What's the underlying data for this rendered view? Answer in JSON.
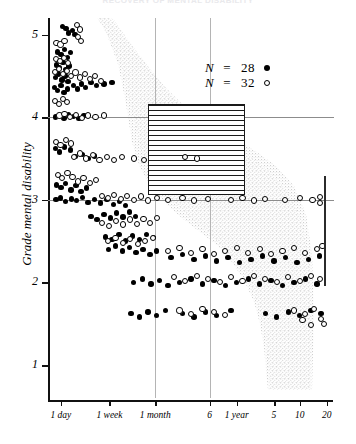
{
  "figure": {
    "title": "RECOVERY OF MENTAL DISABILITY",
    "type": "scatter"
  },
  "axes": {
    "y": {
      "label": "Grade mental disability",
      "ticks": [
        "5",
        "4",
        "3",
        "2",
        "1"
      ],
      "tick_values": [
        5,
        4,
        3,
        2,
        1
      ],
      "range": [
        0.6,
        5.2
      ]
    },
    "x": {
      "label": "",
      "ticks": [
        "1 day",
        "1 week",
        "1 month",
        "6",
        "1 year",
        "5",
        "10",
        "20"
      ],
      "scale": "log-time"
    }
  },
  "legend": {
    "position": "upper-right",
    "entries": [
      {
        "n_symbol": "N",
        "equals": "=",
        "value": "28",
        "marker": "filled"
      },
      {
        "n_symbol": "N",
        "equals": "=",
        "value": "32",
        "marker": "open"
      }
    ]
  },
  "annotations": {
    "hatched_box": {
      "name": "hatched-region",
      "x_from": "1 month",
      "x_to": "6",
      "y_from": 4,
      "y_to": 3,
      "pattern": "horizontal-lines"
    },
    "right_bracket": {
      "name": "range-bracket",
      "y_from": 3.05,
      "y_to": 2.05
    },
    "envelope": {
      "name": "stippled-envelope",
      "description": "grey stippled band of recovery trajectory"
    },
    "gridlines": {
      "horizontal": [
        4,
        3
      ],
      "vertical": [
        "1 month",
        "6"
      ]
    }
  },
  "colors": {
    "ink": "#000000",
    "grid": "#8c8c8c",
    "grid_light": "#b4b4b4",
    "stipple": "#c9c9c9",
    "title_faded": "#e9e9ec"
  },
  "chart_data": {
    "type": "scatter",
    "title": "RECOVERY OF MENTAL DISABILITY",
    "xlabel": "",
    "ylabel": "Grade mental disability",
    "xlim": [
      0,
      1
    ],
    "ylim": [
      0.6,
      5.2
    ],
    "grid": true,
    "legend_position": "upper-right",
    "xtick_labels": [
      "1 day",
      "1 week",
      "1 month",
      "6",
      "1 year",
      "5",
      "10",
      "20"
    ],
    "xtick_positions": [
      0.045,
      0.215,
      0.375,
      0.565,
      0.66,
      0.79,
      0.88,
      0.975
    ],
    "ytick_labels": [
      "5",
      "4",
      "3",
      "2",
      "1"
    ],
    "ytick_positions": [
      5,
      4,
      3,
      2,
      1
    ],
    "series": [
      {
        "name": "N = 28",
        "marker": "filled",
        "n": 28,
        "points": [
          [
            0.05,
            5.1
          ],
          [
            0.063,
            5.07
          ],
          [
            0.072,
            5.02
          ],
          [
            0.086,
            5.05
          ],
          [
            0.095,
            5.0
          ],
          [
            0.034,
            4.79
          ],
          [
            0.046,
            4.76
          ],
          [
            0.058,
            4.82
          ],
          [
            0.068,
            4.72
          ],
          [
            0.079,
            4.78
          ],
          [
            0.03,
            4.63
          ],
          [
            0.041,
            4.6
          ],
          [
            0.052,
            4.66
          ],
          [
            0.063,
            4.58
          ],
          [
            0.074,
            4.62
          ],
          [
            0.026,
            4.48
          ],
          [
            0.037,
            4.52
          ],
          [
            0.049,
            4.45
          ],
          [
            0.06,
            4.5
          ],
          [
            0.07,
            4.43
          ],
          [
            0.022,
            4.36
          ],
          [
            0.034,
            4.32
          ],
          [
            0.045,
            4.38
          ],
          [
            0.056,
            4.3
          ],
          [
            0.068,
            4.34
          ],
          [
            0.09,
            4.38
          ],
          [
            0.104,
            4.34
          ],
          [
            0.118,
            4.4
          ],
          [
            0.132,
            4.36
          ],
          [
            0.15,
            4.42
          ],
          [
            0.17,
            4.38
          ],
          [
            0.196,
            4.4
          ],
          [
            0.224,
            4.42
          ],
          [
            0.026,
            4.0
          ],
          [
            0.04,
            4.02
          ],
          [
            0.056,
            3.99
          ],
          [
            0.072,
            4.03
          ],
          [
            0.09,
            4.01
          ],
          [
            0.108,
            3.98
          ],
          [
            0.126,
            4.02
          ],
          [
            0.026,
            3.62
          ],
          [
            0.04,
            3.58
          ],
          [
            0.058,
            3.64
          ],
          [
            0.078,
            3.6
          ],
          [
            0.096,
            3.52
          ],
          [
            0.12,
            3.55
          ],
          [
            0.14,
            3.5
          ],
          [
            0.162,
            3.53
          ],
          [
            0.03,
            3.18
          ],
          [
            0.046,
            3.15
          ],
          [
            0.062,
            3.2
          ],
          [
            0.08,
            3.12
          ],
          [
            0.098,
            3.17
          ],
          [
            0.116,
            3.1
          ],
          [
            0.134,
            3.14
          ],
          [
            0.028,
            3.0
          ],
          [
            0.044,
            3.02
          ],
          [
            0.062,
            2.98
          ],
          [
            0.082,
            3.01
          ],
          [
            0.1,
            2.99
          ],
          [
            0.12,
            3.03
          ],
          [
            0.14,
            2.97
          ],
          [
            0.162,
            3.0
          ],
          [
            0.184,
            2.96
          ],
          [
            0.206,
            3.0
          ],
          [
            0.228,
            2.94
          ],
          [
            0.25,
            2.98
          ],
          [
            0.272,
            2.93
          ],
          [
            0.15,
            2.8
          ],
          [
            0.172,
            2.76
          ],
          [
            0.196,
            2.82
          ],
          [
            0.218,
            2.78
          ],
          [
            0.24,
            2.84
          ],
          [
            0.262,
            2.79
          ],
          [
            0.284,
            2.85
          ],
          [
            0.306,
            2.8
          ],
          [
            0.2,
            2.55
          ],
          [
            0.224,
            2.52
          ],
          [
            0.248,
            2.58
          ],
          [
            0.272,
            2.5
          ],
          [
            0.296,
            2.56
          ],
          [
            0.32,
            2.52
          ],
          [
            0.344,
            2.58
          ],
          [
            0.368,
            2.54
          ],
          [
            0.212,
            2.4
          ],
          [
            0.236,
            2.44
          ],
          [
            0.26,
            2.38
          ],
          [
            0.284,
            2.42
          ],
          [
            0.308,
            2.36
          ],
          [
            0.332,
            2.4
          ],
          [
            0.356,
            2.34
          ],
          [
            0.38,
            2.38
          ],
          [
            0.43,
            2.3
          ],
          [
            0.47,
            2.34
          ],
          [
            0.51,
            2.28
          ],
          [
            0.55,
            2.32
          ],
          [
            0.59,
            2.26
          ],
          [
            0.63,
            2.3
          ],
          [
            0.67,
            2.24
          ],
          [
            0.71,
            2.28
          ],
          [
            0.75,
            2.32
          ],
          [
            0.79,
            2.26
          ],
          [
            0.83,
            2.3
          ],
          [
            0.87,
            2.24
          ],
          [
            0.91,
            2.28
          ],
          [
            0.95,
            2.32
          ],
          [
            0.3,
            2.0
          ],
          [
            0.33,
            2.04
          ],
          [
            0.36,
            1.98
          ],
          [
            0.39,
            2.02
          ],
          [
            0.42,
            1.96
          ],
          [
            0.46,
            2.0
          ],
          [
            0.5,
            2.04
          ],
          [
            0.54,
            1.98
          ],
          [
            0.58,
            2.02
          ],
          [
            0.62,
            1.96
          ],
          [
            0.66,
            2.0
          ],
          [
            0.7,
            2.04
          ],
          [
            0.74,
            1.98
          ],
          [
            0.78,
            2.02
          ],
          [
            0.82,
            1.96
          ],
          [
            0.86,
            2.0
          ],
          [
            0.9,
            2.04
          ],
          [
            0.94,
            1.98
          ],
          [
            0.29,
            1.62
          ],
          [
            0.32,
            1.58
          ],
          [
            0.35,
            1.64
          ],
          [
            0.38,
            1.6
          ],
          [
            0.41,
            1.66
          ],
          [
            0.47,
            1.62
          ],
          [
            0.51,
            1.58
          ],
          [
            0.55,
            1.64
          ],
          [
            0.59,
            1.6
          ],
          [
            0.64,
            1.66
          ],
          [
            0.76,
            1.62
          ],
          [
            0.8,
            1.58
          ],
          [
            0.84,
            1.64
          ],
          [
            0.88,
            1.6
          ],
          [
            0.92,
            1.66
          ],
          [
            0.955,
            1.62
          ]
        ]
      },
      {
        "name": "N = 32",
        "marker": "open",
        "n": 32,
        "points": [
          [
            0.1,
            5.12
          ],
          [
            0.112,
            5.06
          ],
          [
            0.104,
            4.97
          ],
          [
            0.116,
            4.92
          ],
          [
            0.03,
            4.9
          ],
          [
            0.044,
            4.88
          ],
          [
            0.058,
            4.92
          ],
          [
            0.028,
            4.7
          ],
          [
            0.042,
            4.68
          ],
          [
            0.056,
            4.72
          ],
          [
            0.07,
            4.66
          ],
          [
            0.024,
            4.55
          ],
          [
            0.038,
            4.58
          ],
          [
            0.052,
            4.52
          ],
          [
            0.066,
            4.56
          ],
          [
            0.08,
            4.5
          ],
          [
            0.096,
            4.54
          ],
          [
            0.112,
            4.48
          ],
          [
            0.128,
            4.52
          ],
          [
            0.146,
            4.46
          ],
          [
            0.164,
            4.5
          ],
          [
            0.184,
            4.44
          ],
          [
            0.024,
            4.2
          ],
          [
            0.038,
            4.16
          ],
          [
            0.052,
            4.22
          ],
          [
            0.066,
            4.18
          ],
          [
            0.04,
            4.02
          ],
          [
            0.058,
            4.04
          ],
          [
            0.078,
            4.0
          ],
          [
            0.098,
            4.03
          ],
          [
            0.118,
            3.99
          ],
          [
            0.14,
            4.02
          ],
          [
            0.166,
            4.0
          ],
          [
            0.196,
            4.02
          ],
          [
            0.028,
            3.7
          ],
          [
            0.044,
            3.66
          ],
          [
            0.062,
            3.72
          ],
          [
            0.08,
            3.68
          ],
          [
            0.09,
            3.52
          ],
          [
            0.112,
            3.56
          ],
          [
            0.134,
            3.5
          ],
          [
            0.156,
            3.54
          ],
          [
            0.18,
            3.48
          ],
          [
            0.206,
            3.52
          ],
          [
            0.232,
            3.48
          ],
          [
            0.26,
            3.52
          ],
          [
            0.3,
            3.5
          ],
          [
            0.336,
            3.48
          ],
          [
            0.48,
            3.52
          ],
          [
            0.52,
            3.5
          ],
          [
            0.034,
            3.3
          ],
          [
            0.05,
            3.26
          ],
          [
            0.068,
            3.32
          ],
          [
            0.086,
            3.28
          ],
          [
            0.104,
            3.22
          ],
          [
            0.124,
            3.26
          ],
          [
            0.146,
            3.2
          ],
          [
            0.168,
            3.24
          ],
          [
            0.188,
            3.05
          ],
          [
            0.21,
            3.02
          ],
          [
            0.232,
            3.06
          ],
          [
            0.254,
            3.01
          ],
          [
            0.276,
            3.05
          ],
          [
            0.3,
            3.0
          ],
          [
            0.325,
            3.04
          ],
          [
            0.35,
            2.99
          ],
          [
            0.38,
            3.02
          ],
          [
            0.42,
            3.0
          ],
          [
            0.47,
            3.02
          ],
          [
            0.51,
            2.99
          ],
          [
            0.56,
            3.01
          ],
          [
            0.64,
            3.0
          ],
          [
            0.68,
            3.02
          ],
          [
            0.72,
            2.99
          ],
          [
            0.76,
            3.01
          ],
          [
            0.83,
            3.0
          ],
          [
            0.88,
            3.02
          ],
          [
            0.925,
            3.0
          ],
          [
            0.95,
            3.03
          ],
          [
            0.95,
            2.96
          ],
          [
            0.19,
            2.72
          ],
          [
            0.214,
            2.68
          ],
          [
            0.238,
            2.74
          ],
          [
            0.262,
            2.7
          ],
          [
            0.286,
            2.76
          ],
          [
            0.31,
            2.71
          ],
          [
            0.334,
            2.77
          ],
          [
            0.358,
            2.72
          ],
          [
            0.382,
            2.78
          ],
          [
            0.21,
            2.5
          ],
          [
            0.236,
            2.54
          ],
          [
            0.262,
            2.48
          ],
          [
            0.288,
            2.52
          ],
          [
            0.314,
            2.46
          ],
          [
            0.34,
            2.5
          ],
          [
            0.366,
            2.54
          ],
          [
            0.42,
            2.38
          ],
          [
            0.46,
            2.42
          ],
          [
            0.5,
            2.36
          ],
          [
            0.54,
            2.4
          ],
          [
            0.58,
            2.34
          ],
          [
            0.62,
            2.38
          ],
          [
            0.66,
            2.42
          ],
          [
            0.7,
            2.36
          ],
          [
            0.74,
            2.4
          ],
          [
            0.78,
            2.34
          ],
          [
            0.82,
            2.38
          ],
          [
            0.86,
            2.42
          ],
          [
            0.9,
            2.36
          ],
          [
            0.94,
            2.4
          ],
          [
            0.96,
            2.44
          ],
          [
            0.44,
            2.06
          ],
          [
            0.48,
            2.02
          ],
          [
            0.52,
            2.08
          ],
          [
            0.56,
            2.04
          ],
          [
            0.6,
            2.0
          ],
          [
            0.64,
            2.06
          ],
          [
            0.68,
            2.02
          ],
          [
            0.72,
            2.08
          ],
          [
            0.76,
            2.04
          ],
          [
            0.8,
            2.0
          ],
          [
            0.84,
            2.06
          ],
          [
            0.88,
            2.02
          ],
          [
            0.92,
            2.08
          ],
          [
            0.95,
            2.04
          ],
          [
            0.46,
            1.66
          ],
          [
            0.5,
            1.62
          ],
          [
            0.54,
            1.68
          ],
          [
            0.58,
            1.64
          ],
          [
            0.62,
            1.6
          ],
          [
            0.86,
            1.66
          ],
          [
            0.9,
            1.62
          ],
          [
            0.93,
            1.68
          ],
          [
            0.955,
            1.56
          ],
          [
            0.965,
            1.5
          ],
          [
            0.92,
            1.48
          ],
          [
            0.89,
            1.54
          ]
        ]
      }
    ]
  }
}
